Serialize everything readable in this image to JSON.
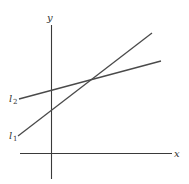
{
  "diagram": {
    "type": "two-lines-graph",
    "axes": {
      "x_label": "x",
      "y_label": "y"
    },
    "lines": [
      {
        "name": "l2",
        "label_main": "l",
        "label_sub": "2",
        "description": "shallower slope, higher y-intercept"
      },
      {
        "name": "l1",
        "label_main": "l",
        "label_sub": "1",
        "description": "steeper slope, lower y-intercept"
      }
    ]
  }
}
